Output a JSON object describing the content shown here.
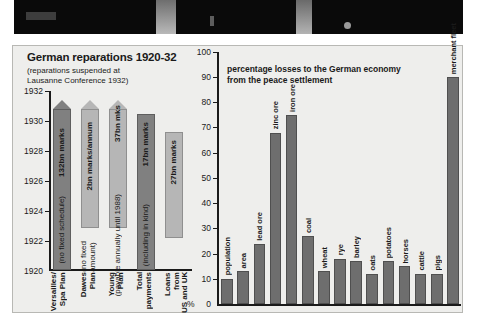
{
  "photo": {
    "alt": "dark photograph strip"
  },
  "left_chart": {
    "title": "German reparations 1920-32",
    "subtitle_line1": "(reparations suspended at",
    "subtitle_line2": "Lausanne Conference 1932)",
    "y_ticks": [
      "1932",
      "1930",
      "1928",
      "1926",
      "1924",
      "1922",
      "1920"
    ],
    "x_labels": [
      "Versailles/\nSpa Plan",
      "Dawes\nPlan",
      "Young\nPlan",
      "Total\npayments",
      "Loans from\nUS and UK"
    ],
    "bars": [
      {
        "name": "Versailles/Spa Plan",
        "amount": "132bn marks",
        "note": "(no fixed schedule)",
        "arrow": true
      },
      {
        "name": "Dawes Plan",
        "amount": "2bn marks/annum",
        "note": "(no fixed\namount)",
        "arrow": true
      },
      {
        "name": "Young Plan",
        "amount": "37bn mks",
        "note": "(payable annually until 1988)",
        "arrow": true
      },
      {
        "name": "Total payments",
        "amount": "17bn marks",
        "note": "(including in kind)",
        "arrow": false
      },
      {
        "name": "Loans from US and UK",
        "amount": "27bn marks",
        "note": "",
        "arrow": false
      }
    ]
  },
  "right_chart": {
    "title_line1": "percentage losses to the German economy",
    "title_line2": "from the peace settlement",
    "percent_symbol": "%",
    "y_ticks": [
      "100",
      "90",
      "80",
      "70",
      "60",
      "50",
      "40",
      "30",
      "20",
      "10",
      "0"
    ]
  },
  "chart_data": [
    {
      "type": "bar",
      "title": "German reparations 1920-32",
      "subtitle": "(reparations suspended at Lausanne Conference 1932)",
      "xlabel": "",
      "ylabel": "",
      "categories": [
        "Versailles/Spa Plan",
        "Dawes Plan",
        "Young Plan",
        "Total payments",
        "Loans from US and UK"
      ],
      "value_labels": [
        "132bn marks",
        "2bn marks/annum",
        "37bn mks",
        "17bn marks",
        "27bn marks"
      ],
      "annotations": [
        "(no fixed schedule)",
        "(no fixed amount)",
        "(payable annually until 1988)",
        "(including in kind)",
        ""
      ],
      "y_tick_labels": [
        "1920",
        "1922",
        "1924",
        "1926",
        "1928",
        "1930",
        "1932"
      ],
      "ylim": [
        1920,
        1932
      ],
      "grid": false,
      "legend": "none",
      "note": "Bar tops drawn as arrowheads for first three entries; y-axis is a timeline not a value scale."
    },
    {
      "type": "bar",
      "title": "percentage losses to the German economy from the peace settlement",
      "xlabel": "",
      "ylabel": "%",
      "categories": [
        "population",
        "area",
        "lead ore",
        "zinc ore",
        "iron ore",
        "coal",
        "wheat",
        "rye",
        "barley",
        "oats",
        "potatoes",
        "horses",
        "cattle",
        "pigs",
        "merchant fleet"
      ],
      "values": [
        10,
        13,
        24,
        68,
        75,
        27,
        13,
        18,
        17,
        12,
        17,
        15,
        12,
        12,
        90
      ],
      "ylim": [
        0,
        100
      ],
      "ytick_step": 10,
      "grid": false,
      "legend": "none"
    }
  ]
}
